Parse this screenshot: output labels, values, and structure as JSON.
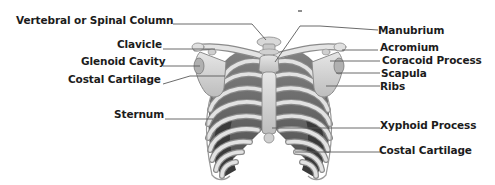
{
  "diagram": {
    "left_labels": [
      {
        "id": "vertebral",
        "text": "Vertebral or Spinal Column"
      },
      {
        "id": "clavicle",
        "text": "Clavicle"
      },
      {
        "id": "glenoid",
        "text": "Glenoid Cavity"
      },
      {
        "id": "costal_left",
        "text": "Costal Cartilage"
      },
      {
        "id": "sternum",
        "text": "Sternum"
      }
    ],
    "right_labels": [
      {
        "id": "manubrium",
        "text": "Manubrium"
      },
      {
        "id": "acromium",
        "text": "Acromium"
      },
      {
        "id": "coracoid",
        "text": "Coracoid Process"
      },
      {
        "id": "scapula",
        "text": "Scapula"
      },
      {
        "id": "ribs",
        "text": "Ribs"
      },
      {
        "id": "xyphoid",
        "text": "Xyphoid Process"
      },
      {
        "id": "costal_right",
        "text": "Costal Cartilage"
      }
    ],
    "colors": {
      "bone": "#d4d4d4",
      "bone_outline": "#8a8a8a",
      "intercostal_dark": "#4a4a4a",
      "intercostal_mid": "#6e6e6e",
      "leader_line": "#5a5a5a",
      "text": "#1c1c1c"
    }
  }
}
